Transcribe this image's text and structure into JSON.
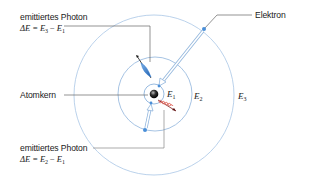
{
  "diagram": {
    "type": "bohr-atom-model",
    "labels": {
      "photon_top": {
        "title": "emittiertes Photon",
        "formula_prefix": "ΔE = ",
        "formula_a": "E",
        "formula_a_sub": "3",
        "formula_minus": " − ",
        "formula_b": "E",
        "formula_b_sub": "1"
      },
      "nucleus": "Atomkern",
      "electron": "Elektron",
      "photon_bottom": {
        "title": "emittiertes Photon",
        "formula_prefix": "ΔE = ",
        "formula_a": "E",
        "formula_a_sub": "2",
        "formula_minus": " − ",
        "formula_b": "E",
        "formula_b_sub": "1"
      }
    },
    "energy_levels": [
      {
        "symbol": "E",
        "sub": "1"
      },
      {
        "symbol": "E",
        "sub": "2"
      },
      {
        "symbol": "E",
        "sub": "3"
      }
    ],
    "colors": {
      "orbit": "#8fb4dc",
      "leader_line": "#555555",
      "photon_high_energy": "#2f7bd0",
      "photon_low_energy": "#d9534f",
      "electron": "#4a8fd8",
      "nucleus": "#222222"
    }
  }
}
